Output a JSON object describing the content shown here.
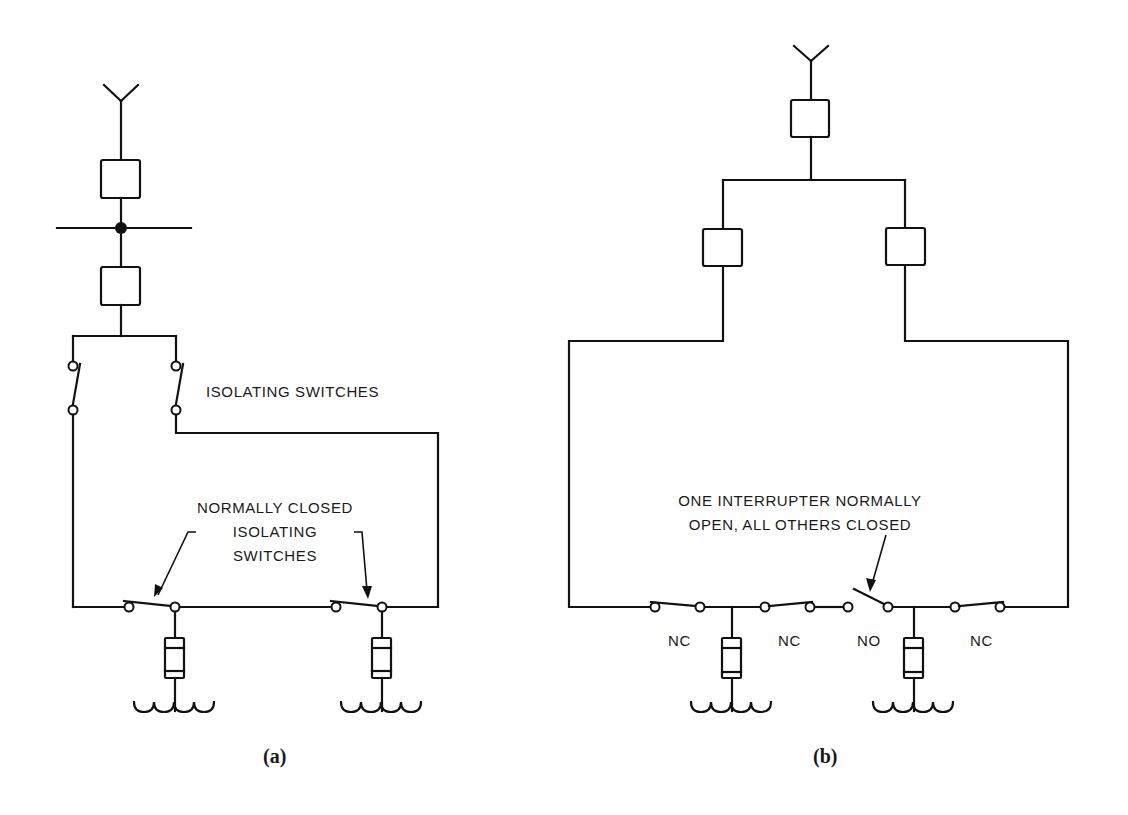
{
  "figure": {
    "panel_a": {
      "caption": "(a)",
      "label_isolating_switches": "ISOLATING SWITCHES",
      "label_nc_line1": "NORMALLY CLOSED",
      "label_nc_line2": "ISOLATING",
      "label_nc_line3": "SWITCHES",
      "components": {
        "antenna": "incoming-feeder-symbol",
        "breakers": 2,
        "bus_with_node": true,
        "isolating_switches": 2,
        "loop_switches": 2,
        "loads": 2
      }
    },
    "panel_b": {
      "caption": "(b)",
      "label_note_line1": "ONE INTERRUPTER NORMALLY",
      "label_note_line2": "OPEN, ALL OTHERS CLOSED",
      "switch_labels": [
        "NC",
        "NC",
        "NO",
        "NC"
      ],
      "components": {
        "antenna": "incoming-feeder-symbol",
        "breakers": 3,
        "loop_switches": 4,
        "loads": 2
      }
    },
    "colors": {
      "ink": "#111111",
      "background": "#ffffff"
    }
  }
}
